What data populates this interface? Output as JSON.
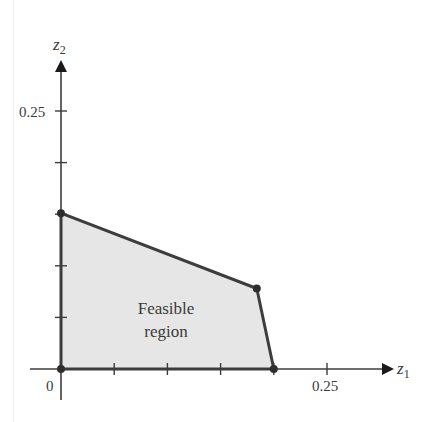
{
  "chart_data": {
    "type": "area",
    "title": "",
    "xlabel": "z1",
    "ylabel": "z2",
    "xlim": [
      0,
      0.3
    ],
    "ylim": [
      0,
      0.3
    ],
    "grid": false,
    "x_ticks": [
      0.05,
      0.1,
      0.15,
      0.2,
      0.25
    ],
    "y_ticks": [
      0.05,
      0.1,
      0.15,
      0.2,
      0.25
    ],
    "x_tick_labels_shown": {
      "0": "0",
      "0.25": "0.25"
    },
    "y_tick_labels_shown": {
      "0.25": "0.25"
    },
    "region": {
      "label_line1": "Feasible",
      "label_line2": "region",
      "vertices": [
        [
          0,
          0
        ],
        [
          0,
          0.151
        ],
        [
          0.184,
          0.078
        ],
        [
          0.2,
          0
        ]
      ],
      "fill": "#e6e6e6",
      "edge": "#3d3d3d"
    }
  },
  "axes": {
    "origin_label": "0",
    "x_tick_label": "0.25",
    "y_tick_label": "0.25",
    "x_axis_name": "z",
    "x_axis_sub": "1",
    "y_axis_name": "z",
    "y_axis_sub": "2"
  },
  "colors": {
    "axis": "#3d3d3d",
    "fill": "#e6e6e6",
    "text": "#3a3a3a"
  }
}
